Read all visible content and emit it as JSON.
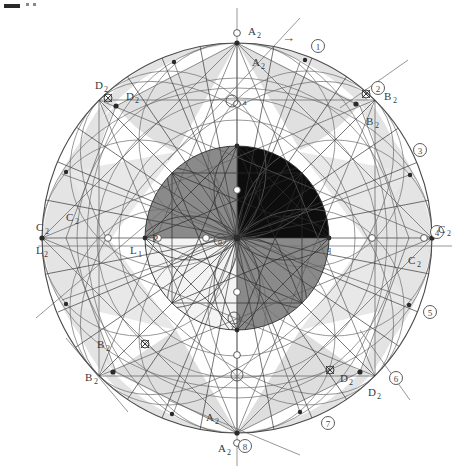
{
  "canvas": {
    "width": 471,
    "height": 473,
    "background": "#ffffff"
  },
  "geometry": {
    "center": {
      "x": 237,
      "y": 238
    },
    "outer_radius": 195,
    "inner_radius": 92,
    "mid_radius": 140
  },
  "colors": {
    "stroke": "#555555",
    "stroke_light": "#8d8d8d",
    "petal": "#e2e2e2",
    "quadrant_upper_right": "#0d0d0d",
    "quadrant_upper_left": "#8a8a8a",
    "quadrant_lower_right": "#8a8a8a",
    "quadrant_lower_left": "#f2f2f2",
    "label": "#3a3a3a"
  },
  "corner_mark": {
    "present": true,
    "label": "図"
  },
  "arrow": {
    "glyph": "→",
    "x": 288,
    "y": 38
  },
  "markers": [
    {
      "id": "m1",
      "num": "1",
      "x": 318,
      "y": 46,
      "angle": -65
    },
    {
      "id": "m2",
      "num": "2",
      "x": 378,
      "y": 88,
      "angle": -35
    },
    {
      "id": "m3",
      "num": "3",
      "x": 420,
      "y": 150,
      "angle": -12
    },
    {
      "id": "m4",
      "num": "4",
      "x": 437,
      "y": 236,
      "angle": 0
    },
    {
      "id": "m5",
      "num": "5",
      "x": 430,
      "y": 312,
      "angle": 20
    },
    {
      "id": "m6",
      "num": "6",
      "x": 396,
      "y": 378,
      "angle": 45
    },
    {
      "id": "m7",
      "num": "7",
      "x": 328,
      "y": 423,
      "angle": 68
    },
    {
      "id": "m8",
      "num": "8",
      "x": 240,
      "y": 446,
      "angle": 90
    }
  ],
  "vertex_labels": [
    {
      "id": "a2-top-outer",
      "text": "A",
      "sub": "2",
      "x": 248,
      "y": 35
    },
    {
      "id": "a2-top-inner",
      "text": "A",
      "sub": "2",
      "x": 252,
      "y": 66
    },
    {
      "id": "d2-ul-outer",
      "text": "D",
      "sub": "2",
      "x": 95,
      "y": 89
    },
    {
      "id": "d2-ul-inner",
      "text": "D",
      "sub": "2",
      "x": 126,
      "y": 100
    },
    {
      "id": "b2-ur-outer",
      "text": "B",
      "sub": "2",
      "x": 384,
      "y": 100
    },
    {
      "id": "b2-ur-inner",
      "text": "B",
      "sub": "2",
      "x": 369,
      "y": 125
    },
    {
      "id": "c2-left-outer",
      "text": "C",
      "sub": "2",
      "x": 36,
      "y": 231
    },
    {
      "id": "c2-left-inner",
      "text": "C",
      "sub": "2",
      "x": 66,
      "y": 221
    },
    {
      "id": "l2-left",
      "text": "L",
      "sub": "2",
      "x": 36,
      "y": 251
    },
    {
      "id": "l1-mid",
      "text": "L",
      "sub": "1",
      "x": 132,
      "y": 251
    },
    {
      "id": "c2-right-outer",
      "text": "C",
      "sub": "2",
      "x": 441,
      "y": 245
    },
    {
      "id": "c2-right-inner",
      "text": "C",
      "sub": "2",
      "x": 408,
      "y": 261
    },
    {
      "id": "b2-ll-inner",
      "text": "B",
      "sub": "2",
      "x": 97,
      "y": 348
    },
    {
      "id": "b2-ll-outer",
      "text": "B",
      "sub": "2",
      "x": 85,
      "y": 381
    },
    {
      "id": "d2-lr-inner",
      "text": "D",
      "sub": "2",
      "x": 342,
      "y": 382
    },
    {
      "id": "d2-lr-outer",
      "text": "D",
      "sub": "2",
      "x": 370,
      "y": 394
    },
    {
      "id": "a2-bot-inner",
      "text": "A",
      "sub": "2",
      "x": 210,
      "y": 421
    },
    {
      "id": "a2-bot-outer",
      "text": "A",
      "sub": "2",
      "x": 222,
      "y": 449
    }
  ],
  "small_labels": [
    {
      "id": "p-label",
      "text": "P",
      "x": 152,
      "y": 239
    },
    {
      "id": "o-label",
      "text": "o",
      "x": 220,
      "y": 241
    },
    {
      "id": "q-label",
      "text": "q",
      "x": 329,
      "y": 250
    },
    {
      "id": "a-label",
      "text": "a",
      "x": 235,
      "y": 102
    },
    {
      "id": "z-label",
      "text": "z",
      "x": 233,
      "y": 327
    }
  ],
  "ring_nodes": [
    {
      "x": 237,
      "y": 43
    },
    {
      "x": 305,
      "y": 60
    },
    {
      "x": 356,
      "y": 104
    },
    {
      "x": 410,
      "y": 175
    },
    {
      "x": 432,
      "y": 238
    },
    {
      "x": 409,
      "y": 305
    },
    {
      "x": 360,
      "y": 372
    },
    {
      "x": 300,
      "y": 412
    },
    {
      "x": 237,
      "y": 433
    },
    {
      "x": 172,
      "y": 414
    },
    {
      "x": 113,
      "y": 372
    },
    {
      "x": 66,
      "y": 304
    },
    {
      "x": 42,
      "y": 238
    },
    {
      "x": 66,
      "y": 172
    },
    {
      "x": 116,
      "y": 106
    },
    {
      "x": 174,
      "y": 62
    }
  ]
}
